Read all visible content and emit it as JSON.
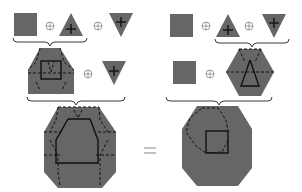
{
  "diagram": {
    "type": "minkowski-sum-associativity",
    "colors": {
      "shape_fill": "#666666",
      "stroke": "#111111",
      "operator": "#888888",
      "background": "#ffffff"
    },
    "operator_symbol": "⊕",
    "equals_symbol": "=",
    "left": {
      "row1": [
        "square",
        "triangle-up-with-cross",
        "triangle-down-with-cross"
      ],
      "row2": [
        "square⊕triangle-up (heptagon)",
        "triangle-down-with-cross"
      ],
      "result": "octagon"
    },
    "right": {
      "row1": [
        "square",
        "triangle-up-with-cross",
        "triangle-down-with-cross"
      ],
      "row2": [
        "square",
        "triangle-up⊕triangle-down (hexagon)"
      ],
      "result": "octagon"
    }
  }
}
